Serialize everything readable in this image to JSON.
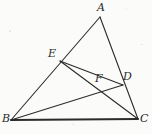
{
  "figure": {
    "kind": "geometry-diagram",
    "background_color": "#fbfbfa",
    "ink_color": "#2b2b2b",
    "canvas": {
      "width": 152,
      "height": 134
    }
  },
  "points": {
    "A": {
      "label": "A",
      "x": 100,
      "y": 17,
      "label_x": 97,
      "label_y": 2
    },
    "B": {
      "label": "B",
      "x": 11,
      "y": 120,
      "label_x": 2,
      "label_y": 113
    },
    "C": {
      "label": "C",
      "x": 138,
      "y": 119,
      "label_x": 140,
      "label_y": 113
    },
    "D": {
      "label": "D",
      "x": 123,
      "y": 85,
      "label_x": 123,
      "label_y": 71
    },
    "E": {
      "label": "E",
      "x": 60,
      "y": 61,
      "label_x": 48,
      "label_y": 48
    },
    "F": {
      "label": "F",
      "x": 99,
      "y": 86,
      "label_x": 95,
      "label_y": 73
    }
  },
  "segments": [
    {
      "name": "side-AB",
      "from": "A",
      "to": "B",
      "width": 1.1
    },
    {
      "name": "side-AC",
      "from": "A",
      "to": "C",
      "width": 1.1
    },
    {
      "name": "side-BC",
      "from": "B",
      "to": "C",
      "width": 1.9
    },
    {
      "name": "cevian-BD",
      "from": "B",
      "to": "D",
      "width": 1.1
    },
    {
      "name": "cevian-CE",
      "from": "C",
      "to": "E",
      "width": 1.1
    },
    {
      "name": "segment-ED",
      "from": "E",
      "to": "D",
      "width": 1.1
    }
  ],
  "labels_order": [
    "A",
    "E",
    "F",
    "D",
    "B",
    "C"
  ]
}
